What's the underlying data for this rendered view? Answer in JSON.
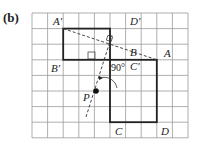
{
  "figure": {
    "part_label": "(b)",
    "grid": {
      "left": 32,
      "top": 13,
      "cols": 10,
      "rows": 8,
      "cell": 15.6,
      "color": "#9a9a9a"
    },
    "original_rect": {
      "name": "ABCD",
      "x": 110,
      "y": 60,
      "w": 46,
      "h": 62
    },
    "image_rect": {
      "name": "A'B'C'D'",
      "x": 63,
      "y": 29,
      "w": 47,
      "h": 31
    },
    "center_P": {
      "x": 96,
      "y": 91
    },
    "angle_label": "90°",
    "labels": {
      "A_prime": "A′",
      "D_prime": "D′",
      "B_prime": "B′",
      "C_prime": "C′",
      "B": "B",
      "A": "A",
      "C": "C",
      "D": "D",
      "P": "P"
    },
    "colors": {
      "line": "#222222",
      "grid": "#9a9a9a"
    }
  }
}
